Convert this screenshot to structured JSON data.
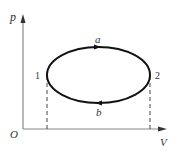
{
  "diagram": {
    "type": "p-V cycle diagram",
    "axes": {
      "y_label": "p",
      "x_label": "V",
      "origin_label": "O"
    },
    "states": [
      {
        "id": "1",
        "label": "1"
      },
      {
        "id": "2",
        "label": "2"
      }
    ],
    "paths": [
      {
        "id": "a",
        "label": "a",
        "from": "1",
        "to": "2",
        "direction": "upper arc, arrow pointing right"
      },
      {
        "id": "b",
        "label": "b",
        "from": "2",
        "to": "1",
        "direction": "lower arc, arrow pointing left"
      }
    ],
    "colors": {
      "axis": "#888888",
      "curve": "#111111",
      "dashed": "#444444",
      "text": "#333333"
    }
  }
}
